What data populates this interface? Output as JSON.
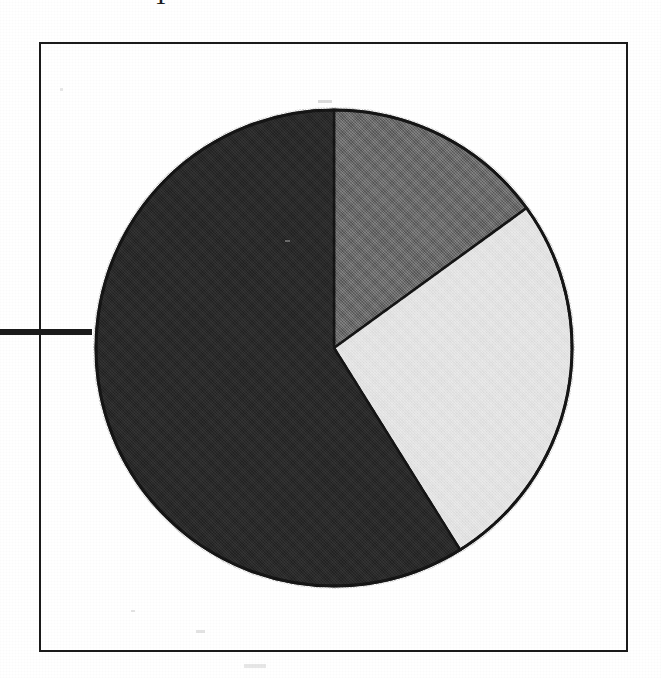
{
  "figure": {
    "kind": "scanned-pie-chart-figure",
    "frame_border_color": "#1b1b1b",
    "page_background": "#ffffff",
    "cropped_glyph_top": "T",
    "leader_line_color": "#1b1b1b"
  },
  "chart_data": {
    "type": "pie",
    "title": "",
    "subtitle": "",
    "xlabel": "",
    "ylabel": "",
    "grid": false,
    "legend_position": "none",
    "start_angle_deg": 0,
    "direction": "clockwise",
    "categories": [
      "Segment 1",
      "Segment 2",
      "Segment 3"
    ],
    "values": [
      15,
      26,
      59
    ],
    "series": [
      {
        "name": "Share",
        "values": [
          15,
          26,
          59
        ]
      }
    ],
    "slices": [
      {
        "label": "Segment 1",
        "value": 15,
        "percent": "15%",
        "color": "#6a6a6a",
        "shade": "medium-gray",
        "start_angle_deg": 0,
        "end_angle_deg": 54
      },
      {
        "label": "Segment 2",
        "value": 26,
        "percent": "26%",
        "color": "#e4e4e4",
        "shade": "light-gray",
        "start_angle_deg": 54,
        "end_angle_deg": 148
      },
      {
        "label": "Segment 3",
        "value": 59,
        "percent": "59%",
        "color": "#2a2a2a",
        "shade": "near-black",
        "start_angle_deg": 148,
        "end_angle_deg": 360
      }
    ],
    "total": 100,
    "units": "percent",
    "outline_color": "#151515"
  }
}
